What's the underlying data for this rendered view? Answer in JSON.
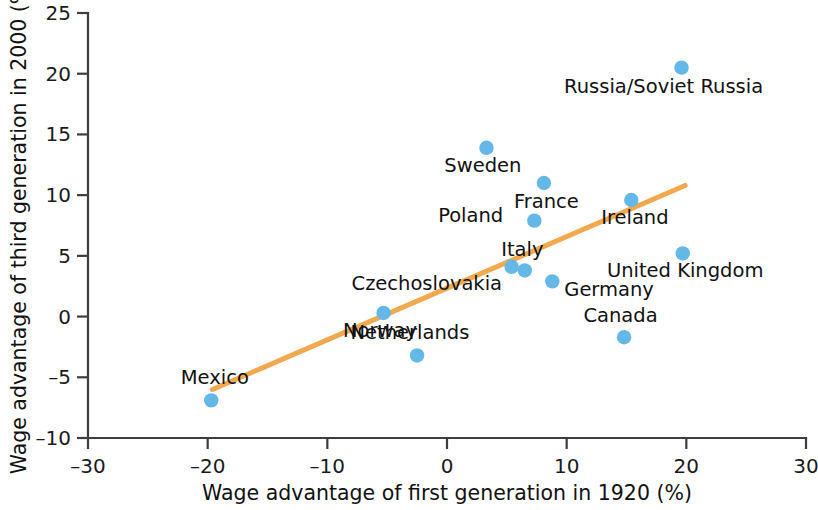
{
  "chart_data": {
    "type": "scatter",
    "title": "",
    "xlabel": "Wage advantage of first generation in 1920 (%)",
    "ylabel": "Wage advantage of third generation in 2000 (%)",
    "xlim": [
      -30,
      30
    ],
    "ylim": [
      -10,
      25
    ],
    "xticks": [
      -30,
      -20,
      -10,
      0,
      10,
      20,
      30
    ],
    "yticks": [
      -10,
      -5,
      0,
      5,
      10,
      15,
      20,
      25
    ],
    "xtick_labels": [
      "–30",
      "–20",
      "–10",
      "0",
      "10",
      "20",
      "30"
    ],
    "ytick_labels": [
      "–10",
      "–5",
      "0",
      "5",
      "10",
      "15",
      "20",
      "25"
    ],
    "grid": false,
    "legend": "none",
    "point_color": "#63b8e8",
    "trend_color": "#f0a94e",
    "points": [
      {
        "label": "Russia/Soviet Russia",
        "x": 19.6,
        "y": 20.5,
        "label_dx": -1.5,
        "label_dy": -1.5,
        "label_anchor": "middle"
      },
      {
        "label": "Sweden",
        "x": 3.3,
        "y": 13.9,
        "label_dx": -0.3,
        "label_dy": -1.4,
        "label_anchor": "middle"
      },
      {
        "label": "France",
        "x": 8.1,
        "y": 11.0,
        "label_dx": 0.2,
        "label_dy": -1.5,
        "label_anchor": "middle"
      },
      {
        "label": "Ireland",
        "x": 15.4,
        "y": 9.6,
        "label_dx": 0.3,
        "label_dy": -1.4,
        "label_anchor": "middle"
      },
      {
        "label": "Poland",
        "x": 7.3,
        "y": 7.9,
        "label_dx": -2.6,
        "label_dy": 0.5,
        "label_anchor": "end"
      },
      {
        "label": "United Kingdom",
        "x": 19.7,
        "y": 5.2,
        "label_dx": 0.2,
        "label_dy": -1.4,
        "label_anchor": "middle"
      },
      {
        "label": "Czechoslovakia",
        "x": 5.4,
        "y": 4.1,
        "label_dx": -0.8,
        "label_dy": -1.3,
        "label_anchor": "end"
      },
      {
        "label": "Italy",
        "x": 6.5,
        "y": 3.8,
        "label_dx": -0.2,
        "label_dy": 1.8,
        "label_anchor": "middle"
      },
      {
        "label": "Germany",
        "x": 8.8,
        "y": 2.9,
        "label_dx": 1.0,
        "label_dy": -0.6,
        "label_anchor": "start"
      },
      {
        "label": "Norway",
        "x": -5.3,
        "y": 0.3,
        "label_dx": -0.3,
        "label_dy": -1.4,
        "label_anchor": "middle"
      },
      {
        "label": "Canada",
        "x": 14.8,
        "y": -1.7,
        "label_dx": -0.3,
        "label_dy": 1.8,
        "label_anchor": "middle"
      },
      {
        "label": "Netherlands",
        "x": -2.5,
        "y": -3.2,
        "label_dx": -0.6,
        "label_dy": 1.9,
        "label_anchor": "middle"
      },
      {
        "label": "Mexico",
        "x": -19.7,
        "y": -6.9,
        "label_dx": 0.3,
        "label_dy": 1.9,
        "label_anchor": "middle"
      }
    ],
    "trend": {
      "x0": -19.6,
      "y0": -6.0,
      "x1": 19.9,
      "y1": 10.8
    }
  }
}
